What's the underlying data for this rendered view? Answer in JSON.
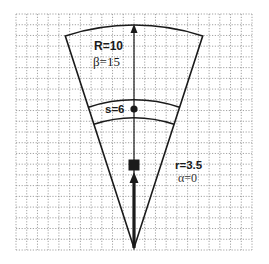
{
  "diagram": {
    "type": "sector-on-grid",
    "grid": {
      "x0": 16,
      "y0": 14,
      "x1": 252,
      "y1": 250,
      "cells": 22,
      "color": "#8a8a8a"
    },
    "apex": {
      "x": 134,
      "y": 248
    },
    "sector": {
      "outer_radius_px": 223,
      "corner_left": {
        "x": 64,
        "y": 35
      },
      "corner_right": {
        "x": 203,
        "y": 35
      }
    },
    "band": {
      "inner_radius_px": 130,
      "outer_radius_px": 148
    },
    "labels": {
      "R": "R=10",
      "beta": "β=15",
      "s": "s=6",
      "r": "r=3.5",
      "alpha": "α=0"
    },
    "markers": {
      "dot": {
        "x": 134,
        "y": 109
      },
      "square": {
        "x": 134,
        "y": 165,
        "size": 11
      }
    },
    "colors": {
      "line": "#1a1a1a",
      "text": "#1a1a1a",
      "grid": "#8a8a8a",
      "background": "#ffffff"
    }
  }
}
